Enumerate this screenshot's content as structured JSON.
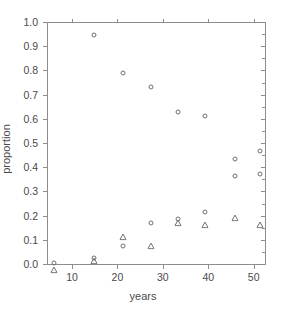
{
  "chart_data": {
    "type": "scatter",
    "title": "",
    "xlabel": "years",
    "ylabel": "proportion",
    "xlim": [
      4.5,
      52.5
    ],
    "ylim": [
      0.0,
      1.0
    ],
    "grid": false,
    "legend": "none",
    "xticks": [
      10,
      20,
      30,
      40,
      50
    ],
    "xtick_labels": [
      "10",
      "20",
      "30",
      "40",
      "50"
    ],
    "yticks": [
      0.0,
      0.1,
      0.2,
      0.3,
      0.4,
      0.5,
      0.6,
      0.7,
      0.8,
      0.9,
      1.0
    ],
    "ytick_labels": [
      "0.0",
      "0.1",
      "0.2",
      "0.3",
      "0.4",
      "0.5",
      "0.6",
      "0.7",
      "0.8",
      "0.9",
      "1.0"
    ],
    "marker_color": "#6f6f6f",
    "axis_color": "#8d8d8d",
    "frame": "box",
    "series": [
      {
        "name": "circles",
        "marker": "open-circle",
        "points": [
          {
            "x": 6.0,
            "y": 0.005
          },
          {
            "x": 14.8,
            "y": 0.945
          },
          {
            "x": 21.3,
            "y": 0.79
          },
          {
            "x": 27.3,
            "y": 0.733
          },
          {
            "x": 33.3,
            "y": 0.63
          },
          {
            "x": 39.3,
            "y": 0.61
          },
          {
            "x": 46.0,
            "y": 0.435
          },
          {
            "x": 46.0,
            "y": 0.365
          },
          {
            "x": 51.3,
            "y": 0.465
          },
          {
            "x": 51.3,
            "y": 0.37
          },
          {
            "x": 14.8,
            "y": 0.025
          },
          {
            "x": 21.3,
            "y": 0.073
          },
          {
            "x": 27.3,
            "y": 0.17
          },
          {
            "x": 33.3,
            "y": 0.185
          },
          {
            "x": 39.3,
            "y": 0.215
          }
        ]
      },
      {
        "name": "triangles",
        "marker": "open-triangle",
        "points": [
          {
            "x": 6.0,
            "y": 0.005
          },
          {
            "x": 14.8,
            "y": 0.04
          },
          {
            "x": 21.3,
            "y": 0.14
          },
          {
            "x": 27.3,
            "y": 0.105
          },
          {
            "x": 33.3,
            "y": 0.2
          },
          {
            "x": 39.3,
            "y": 0.19
          },
          {
            "x": 46.0,
            "y": 0.22
          },
          {
            "x": 51.3,
            "y": 0.19
          }
        ]
      }
    ]
  }
}
